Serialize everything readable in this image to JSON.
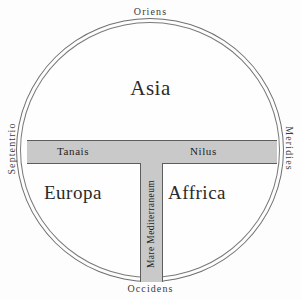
{
  "map": {
    "type": "T-O map (Orbis Terrarum)",
    "cardinals": {
      "top": "Oriens",
      "bottom": "Occidens",
      "left": "Septentrio",
      "right": "Meridies"
    },
    "regions": {
      "asia": "Asia",
      "europa": "Europa",
      "affrica": "Affrica"
    },
    "waters": {
      "tanais": "Tanais",
      "nilus": "Nilus",
      "mediterraneum": "Mare Mediterraneum"
    },
    "colors": {
      "band_fill": "#c9c9c9",
      "band_stroke": "#5d5d5d",
      "circle_stroke": "#6f6f6f",
      "background": "#fdfdfd",
      "text": "#2a2a2a"
    }
  }
}
